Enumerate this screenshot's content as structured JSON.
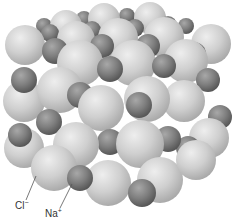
{
  "figure": {
    "labels": {
      "chloride": {
        "text": "Cl",
        "charge": "−"
      },
      "sodium": {
        "text": "Na",
        "charge": "+"
      }
    },
    "colors": {
      "chloride": "#c8c8c8",
      "sodium": "#7a7a7a",
      "leader_line": "#555555",
      "background": "#ffffff"
    },
    "spheres": [
      {
        "type": "na",
        "x": 44,
        "y": 26,
        "r": 8
      },
      {
        "type": "na",
        "x": 84,
        "y": 19,
        "r": 8
      },
      {
        "type": "na",
        "x": 127,
        "y": 16,
        "r": 8
      },
      {
        "type": "na",
        "x": 186,
        "y": 26,
        "r": 8
      },
      {
        "type": "cl",
        "x": 66,
        "y": 26,
        "r": 16
      },
      {
        "type": "cl",
        "x": 104,
        "y": 19,
        "r": 16
      },
      {
        "type": "cl",
        "x": 150,
        "y": 18,
        "r": 16
      },
      {
        "type": "na",
        "x": 50,
        "y": 33,
        "r": 9
      },
      {
        "type": "na",
        "x": 92,
        "y": 30,
        "r": 9
      },
      {
        "type": "na",
        "x": 135,
        "y": 28,
        "r": 9
      },
      {
        "type": "na",
        "x": 168,
        "y": 25,
        "r": 9
      },
      {
        "type": "cl",
        "x": 25,
        "y": 45,
        "r": 20
      },
      {
        "type": "cl",
        "x": 76,
        "y": 40,
        "r": 19
      },
      {
        "type": "cl",
        "x": 118,
        "y": 38,
        "r": 20
      },
      {
        "type": "cl",
        "x": 164,
        "y": 37,
        "r": 20
      },
      {
        "type": "cl",
        "x": 211,
        "y": 44,
        "r": 20
      },
      {
        "type": "na",
        "x": 55,
        "y": 51,
        "r": 13
      },
      {
        "type": "na",
        "x": 102,
        "y": 46,
        "r": 12
      },
      {
        "type": "na",
        "x": 148,
        "y": 46,
        "r": 12
      },
      {
        "type": "na",
        "x": 194,
        "y": 54,
        "r": 12
      },
      {
        "type": "cl",
        "x": 80,
        "y": 63,
        "r": 23
      },
      {
        "type": "cl",
        "x": 133,
        "y": 63,
        "r": 23
      },
      {
        "type": "cl",
        "x": 186,
        "y": 61,
        "r": 22
      },
      {
        "type": "na",
        "x": 110,
        "y": 69,
        "r": 13
      },
      {
        "type": "na",
        "x": 164,
        "y": 66,
        "r": 12
      },
      {
        "type": "na",
        "x": 208,
        "y": 80,
        "r": 12
      },
      {
        "type": "cl",
        "x": 24,
        "y": 101,
        "r": 21
      },
      {
        "type": "cl",
        "x": 184,
        "y": 101,
        "r": 21
      },
      {
        "type": "na",
        "x": 24,
        "y": 80,
        "r": 13
      },
      {
        "type": "cl",
        "x": 60,
        "y": 90,
        "r": 23
      },
      {
        "type": "cl",
        "x": 147,
        "y": 99,
        "r": 23
      },
      {
        "type": "na",
        "x": 80,
        "y": 95,
        "r": 13
      },
      {
        "type": "na",
        "x": 139,
        "y": 105,
        "r": 13
      },
      {
        "type": "cl",
        "x": 101,
        "y": 108,
        "r": 23
      },
      {
        "type": "na",
        "x": 220,
        "y": 117,
        "r": 12
      },
      {
        "type": "cl",
        "x": 209,
        "y": 138,
        "r": 20
      },
      {
        "type": "na",
        "x": 188,
        "y": 148,
        "r": 12
      },
      {
        "type": "na",
        "x": 49,
        "y": 122,
        "r": 13
      },
      {
        "type": "cl",
        "x": 24,
        "y": 148,
        "r": 20
      },
      {
        "type": "na",
        "x": 110,
        "y": 142,
        "r": 13
      },
      {
        "type": "na",
        "x": 168,
        "y": 139,
        "r": 13
      },
      {
        "type": "cl",
        "x": 76,
        "y": 145,
        "r": 23
      },
      {
        "type": "cl",
        "x": 140,
        "y": 144,
        "r": 24
      },
      {
        "type": "na",
        "x": 20,
        "y": 135,
        "r": 12
      },
      {
        "type": "na",
        "x": 192,
        "y": 163,
        "r": 12
      },
      {
        "type": "cl",
        "x": 160,
        "y": 180,
        "r": 23
      },
      {
        "type": "cl",
        "x": 54,
        "y": 168,
        "r": 23
      },
      {
        "type": "cl",
        "x": 108,
        "y": 183,
        "r": 23
      },
      {
        "type": "na",
        "x": 80,
        "y": 178,
        "r": 13
      },
      {
        "type": "na",
        "x": 142,
        "y": 193,
        "r": 14
      },
      {
        "type": "cl",
        "x": 196,
        "y": 160,
        "r": 20
      }
    ]
  }
}
